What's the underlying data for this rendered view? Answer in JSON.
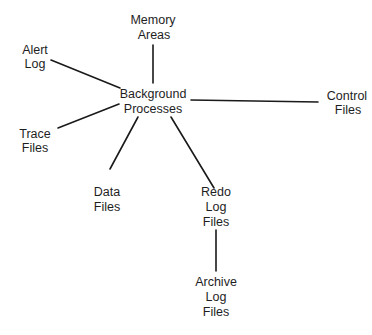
{
  "diagram": {
    "type": "hub-and-spoke",
    "hub": {
      "id": "background_processes",
      "lines": [
        "Background",
        "Processes"
      ]
    },
    "nodes": {
      "memory_areas": {
        "lines": [
          "Memory",
          "Areas"
        ]
      },
      "alert_log": {
        "lines": [
          "Alert",
          "Log"
        ]
      },
      "trace_files": {
        "lines": [
          "Trace",
          "Files"
        ]
      },
      "control_files": {
        "lines": [
          "Control",
          "Files"
        ]
      },
      "data_files": {
        "lines": [
          "Data",
          "Files"
        ]
      },
      "redo_log_files": {
        "lines": [
          "Redo",
          "Log",
          "Files"
        ]
      },
      "archive_log_files": {
        "lines": [
          "Archive",
          "Log",
          "Files"
        ]
      }
    },
    "edges": [
      {
        "from": "background_processes",
        "to": "memory_areas"
      },
      {
        "from": "background_processes",
        "to": "alert_log"
      },
      {
        "from": "background_processes",
        "to": "trace_files"
      },
      {
        "from": "background_processes",
        "to": "control_files"
      },
      {
        "from": "background_processes",
        "to": "data_files"
      },
      {
        "from": "background_processes",
        "to": "redo_log_files"
      },
      {
        "from": "redo_log_files",
        "to": "archive_log_files"
      }
    ],
    "colors": {
      "line": "#1a1a1a",
      "text": "#1e1e1e",
      "background": "#ffffff"
    }
  }
}
